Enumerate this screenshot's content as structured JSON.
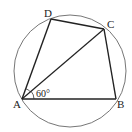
{
  "diagram": {
    "type": "geometry",
    "circle": {
      "cx": 70,
      "cy": 71,
      "r": 56,
      "color": "#555555"
    },
    "points": {
      "A": {
        "label": "A",
        "x": 22,
        "y": 99
      },
      "B": {
        "label": "B",
        "x": 116,
        "y": 99
      },
      "C": {
        "label": "C",
        "x": 104,
        "y": 29
      },
      "D": {
        "label": "D",
        "x": 51,
        "y": 19
      }
    },
    "segments": [
      "AB",
      "BC",
      "CD",
      "DA",
      "AC"
    ],
    "angle": {
      "vertex": "A",
      "between": [
        "AB",
        "AC"
      ],
      "label": "60°"
    },
    "line_color": "#222222"
  }
}
